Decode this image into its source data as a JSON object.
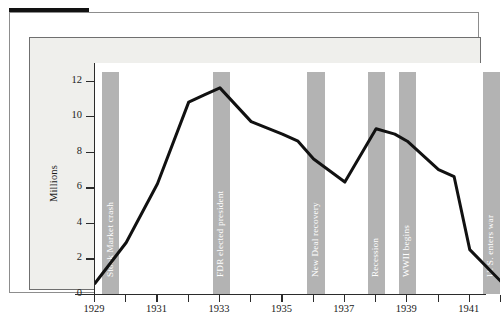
{
  "figure": {
    "background": "#ffffff",
    "panel_background": "#efefec",
    "plot_background": "#ffffff",
    "band_color": "#b3b3b3",
    "line_color": "#111111",
    "axis_color": "#2b2b2b",
    "band_label_color": "#ffffff"
  },
  "chart_data": {
    "type": "line",
    "title": "",
    "subtitle": "",
    "xlabel": "",
    "ylabel": "Millions",
    "xlim": [
      1929,
      1942
    ],
    "ylim": [
      0,
      13
    ],
    "grid": false,
    "legend": null,
    "y_ticks": [
      0,
      2,
      4,
      6,
      8,
      10,
      12
    ],
    "y_tick_labels": [
      "0",
      "2",
      "4",
      "6",
      "8",
      "10",
      "12"
    ],
    "x_ticks": [
      1929,
      1930,
      1931,
      1932,
      1933,
      1934,
      1935,
      1936,
      1937,
      1938,
      1939,
      1940,
      1941,
      1942
    ],
    "x_tick_labels": [
      "1929",
      "",
      "1931",
      "",
      "1933",
      "",
      "1935",
      "",
      "1937",
      "",
      "1939",
      "",
      "1941",
      ""
    ],
    "x_labeled_ticks": [
      {
        "year": 1929,
        "label": "1929"
      },
      {
        "year": 1931,
        "label": "1931"
      },
      {
        "year": 1933,
        "label": "1933"
      },
      {
        "year": 1935,
        "label": "1935"
      },
      {
        "year": 1937,
        "label": "1937"
      },
      {
        "year": 1939,
        "label": "1939"
      },
      {
        "year": 1941,
        "label": "1941"
      }
    ],
    "x": [
      1929,
      1930,
      1931,
      1932,
      1932.5,
      1933,
      1934,
      1935,
      1935.5,
      1936,
      1937,
      1938,
      1938.6,
      1939,
      1940,
      1940.5,
      1941,
      1942
    ],
    "values": [
      0.6,
      2.9,
      6.2,
      10.8,
      11.2,
      11.6,
      9.7,
      9.0,
      8.6,
      7.6,
      6.3,
      9.3,
      9.0,
      8.6,
      7.0,
      6.6,
      2.5,
      0.7
    ],
    "series": [
      {
        "name": "Unemployment (millions)",
        "points": [
          {
            "x": 1929,
            "y": 0.6
          },
          {
            "x": 1930,
            "y": 2.9
          },
          {
            "x": 1931,
            "y": 6.2
          },
          {
            "x": 1932,
            "y": 10.8
          },
          {
            "x": 1933,
            "y": 11.6
          },
          {
            "x": 1934,
            "y": 9.7
          },
          {
            "x": 1935,
            "y": 9.0
          },
          {
            "x": 1936,
            "y": 7.6
          },
          {
            "x": 1937,
            "y": 6.3
          },
          {
            "x": 1938,
            "y": 9.3
          },
          {
            "x": 1939,
            "y": 8.6
          },
          {
            "x": 1940,
            "y": 7.0
          },
          {
            "x": 1941,
            "y": 2.5
          },
          {
            "x": 1942,
            "y": 0.7
          }
        ]
      }
    ],
    "annotation_bands": [
      {
        "label": "Stock Market crash",
        "x_start": 1929.22,
        "x_end": 1929.78
      },
      {
        "label": "FDR elected president",
        "x_start": 1932.77,
        "x_end": 1933.33
      },
      {
        "label": "New Deal recovery",
        "x_start": 1935.8,
        "x_end": 1936.36
      },
      {
        "label": "Recession",
        "x_start": 1937.73,
        "x_end": 1938.29
      },
      {
        "label": "WWII begins",
        "x_start": 1938.72,
        "x_end": 1939.28
      },
      {
        "label": "U. S. enters war",
        "x_start": 1941.41,
        "x_end": 1941.97
      }
    ]
  }
}
